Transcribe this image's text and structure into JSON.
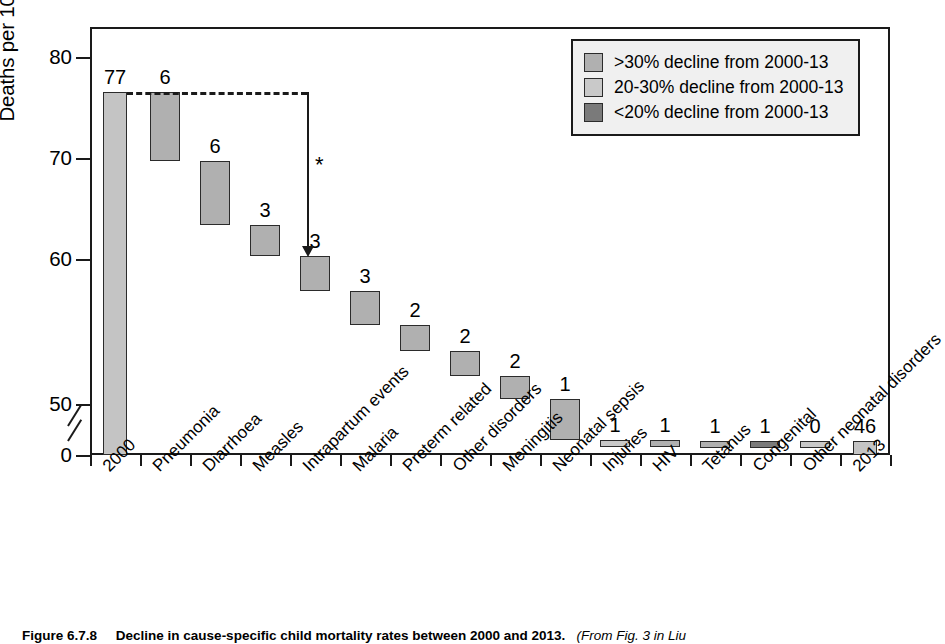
{
  "chart_data": {
    "type": "bar",
    "title": "",
    "subtitle": "",
    "xlabel": "",
    "ylabel": "Deaths per 1000 livebirths",
    "ylim": [
      0,
      84
    ],
    "y_ticks": [
      0,
      50,
      60,
      70,
      80
    ],
    "y_axis_break": true,
    "y_axis_break_between": [
      0,
      50
    ],
    "grid": false,
    "legend_position": "top-right",
    "categories": [
      "2000",
      "Pneumonia",
      "Diarrhoea",
      "Measles",
      "Intrapartum events",
      "Malaria",
      "Preterm related",
      "Other disorders",
      "Meningitis",
      "Neonatal sepsis",
      "Injuries",
      "HIV",
      "Tetanus",
      "Congenital",
      "Other neonatal disorders",
      "2013"
    ],
    "data_labels": [
      "77",
      "6",
      "6",
      "3",
      "3",
      "3",
      "2",
      "2",
      "2",
      "1",
      "1",
      "1",
      "1",
      "1",
      "0",
      "46"
    ],
    "bars": [
      {
        "label": "2000",
        "value": 77,
        "kind": "total",
        "top": 77,
        "bottom": 0,
        "series": "total"
      },
      {
        "label": "Pneumonia",
        "value": 6,
        "kind": "decline",
        "top": 77,
        "bottom": 71,
        "series": ">30% decline from 2000-13"
      },
      {
        "label": "Diarrhoea",
        "value": 6,
        "kind": "decline",
        "top": 71,
        "bottom": 65.5,
        "series": ">30% decline from 2000-13"
      },
      {
        "label": "Measles",
        "value": 3,
        "kind": "decline",
        "top": 65.5,
        "bottom": 62.8,
        "series": ">30% decline from 2000-13"
      },
      {
        "label": "Intrapartum events",
        "value": 3,
        "kind": "decline",
        "top": 62.8,
        "bottom": 59.8,
        "series": ">30% decline from 2000-13"
      },
      {
        "label": "Malaria",
        "value": 3,
        "kind": "decline",
        "top": 59.8,
        "bottom": 56.8,
        "series": ">30% decline from 2000-13"
      },
      {
        "label": "Preterm related",
        "value": 2,
        "kind": "decline",
        "top": 56.8,
        "bottom": 54.6,
        "series": ">30% decline from 2000-13"
      },
      {
        "label": "Other disorders",
        "value": 2,
        "kind": "decline",
        "top": 54.6,
        "bottom": 52.4,
        "series": ">30% decline from 2000-13"
      },
      {
        "label": "Meningitis",
        "value": 2,
        "kind": "decline",
        "top": 52.4,
        "bottom": 50.4,
        "series": ">30% decline from 2000-13"
      },
      {
        "label": "Neonatal sepsis",
        "value": 1,
        "kind": "decline",
        "top": 50.4,
        "bottom": 48.9,
        "series": ">30% decline from 2000-13"
      },
      {
        "label": "Injuries",
        "value": 1,
        "kind": "decline",
        "top": 48.9,
        "bottom": 47.5,
        "series": "20-30% decline from 2000-13"
      },
      {
        "label": "HIV",
        "value": 1,
        "kind": "decline",
        "top": 47.5,
        "bottom": 46.4,
        "series": ">30% decline from 2000-13"
      },
      {
        "label": "Tetanus",
        "value": 1,
        "kind": "decline",
        "top": 46.4,
        "bottom": 45.5,
        "series": ">30% decline from 2000-13"
      },
      {
        "label": "Congenital",
        "value": 1,
        "kind": "decline",
        "top": 45.5,
        "bottom": 44.6,
        "series": "<20% decline from 2000-13"
      },
      {
        "label": "Other neonatal disorders",
        "value": 0,
        "kind": "decline",
        "top": 44.6,
        "bottom": 44.0,
        "series": "20-30% decline from 2000-13"
      },
      {
        "label": "2013",
        "value": 46,
        "kind": "total",
        "top": 46,
        "bottom": 0,
        "series": "total"
      }
    ],
    "annotations": [
      {
        "name": "significance-asterisk",
        "text": "*"
      },
      {
        "name": "decline-arrow",
        "text": "",
        "from": "2000 (77)",
        "to": "Intrapartum events"
      }
    ]
  },
  "y_axis": {
    "title": "Deaths per 1000 livebirths",
    "ticks": [
      "80",
      "70",
      "60",
      "50",
      "0"
    ]
  },
  "legend": {
    "items": [
      {
        "label": ">30% decline from 2000-13",
        "color": "#b0b0b0"
      },
      {
        "label": "20-30% decline from 2000-13",
        "color": "#c9c9c9"
      },
      {
        "label": "<20% decline from 2000-13",
        "color": "#7a7a7a"
      }
    ]
  },
  "annotation": {
    "asterisk": "*"
  },
  "caption": {
    "figure_number": "Figure 6.7.8",
    "text": "Decline in cause-specific child mortality rates between 2000 and 2013.",
    "source": "(From Fig. 3 in Liu"
  }
}
